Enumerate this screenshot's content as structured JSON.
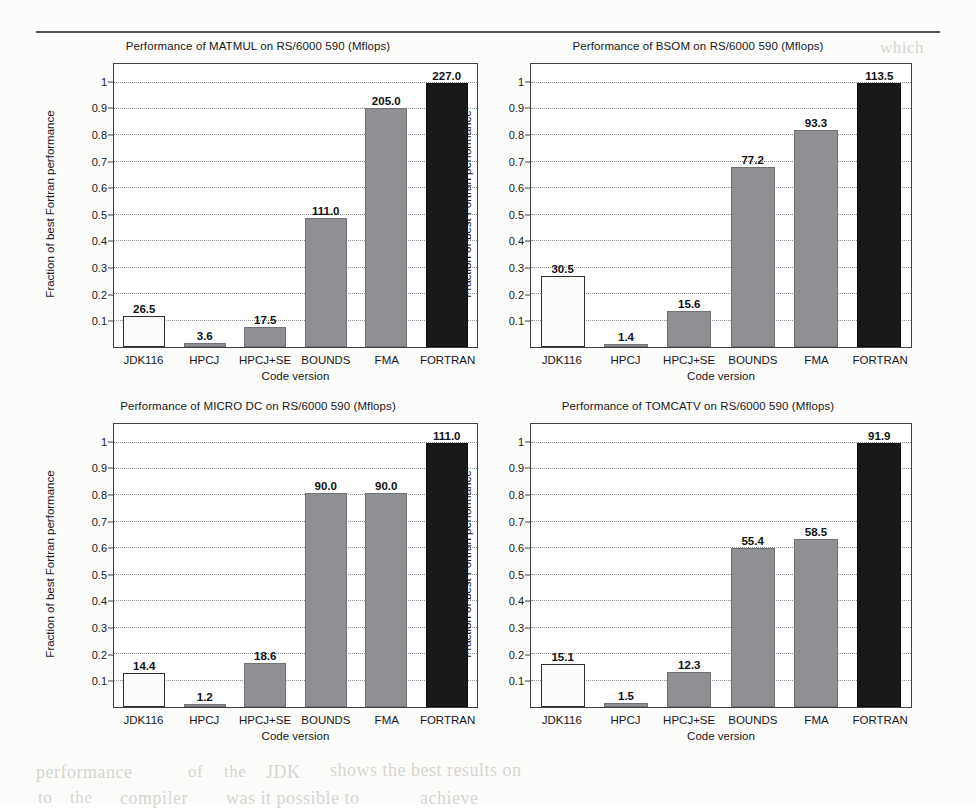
{
  "page": {
    "categories": [
      "JDK116",
      "HPCJ",
      "HPCJ+SE",
      "BOUNDS",
      "FMA",
      "FORTRAN"
    ],
    "ylabel": "Fraction of best Fortran performance",
    "xlabel": "Code version",
    "yticks": [
      "0.1",
      "0.2",
      "0.3",
      "0.4",
      "0.5",
      "0.6",
      "0.7",
      "0.8",
      "0.9",
      "1"
    ],
    "colors": {
      "bar_light": "#fbfbfa",
      "bar_gray": "#8e9093",
      "bar_black": "#18191b",
      "frame": "#3f4245",
      "grid": "#8d9093",
      "text": "#16181a"
    },
    "ghost_texts": [
      {
        "text": "which",
        "x": 880,
        "y": 38,
        "size": 17
      },
      {
        "text": "the",
        "x": 742,
        "y": 66,
        "size": 17
      },
      {
        "text": "benchmark",
        "x": 640,
        "y": 98,
        "size": 18
      },
      {
        "text": "of",
        "x": 790,
        "y": 128,
        "size": 17
      },
      {
        "text": "performance",
        "x": 36,
        "y": 762,
        "size": 18
      },
      {
        "text": "of",
        "x": 188,
        "y": 762,
        "size": 17
      },
      {
        "text": "the",
        "x": 224,
        "y": 762,
        "size": 17
      },
      {
        "text": "JDK",
        "x": 266,
        "y": 762,
        "size": 18
      },
      {
        "text": "shows the best results on",
        "x": 330,
        "y": 760,
        "size": 18
      },
      {
        "text": "to",
        "x": 38,
        "y": 788,
        "size": 17
      },
      {
        "text": "the",
        "x": 70,
        "y": 788,
        "size": 17
      },
      {
        "text": "compiler",
        "x": 120,
        "y": 788,
        "size": 18
      },
      {
        "text": "was it possible to",
        "x": 226,
        "y": 788,
        "size": 18
      },
      {
        "text": "achieve",
        "x": 420,
        "y": 788,
        "size": 18
      }
    ]
  },
  "chart_data": [
    {
      "type": "bar",
      "title": "Performance of MATMUL on RS/6000 590 (Mflops)",
      "xlabel": "Code version",
      "ylabel": "Fraction of best Fortran performance",
      "categories": [
        "JDK116",
        "HPCJ",
        "HPCJ+SE",
        "BOUNDS",
        "FMA",
        "FORTRAN"
      ],
      "values": [
        26.5,
        3.6,
        17.5,
        111.0,
        205.0,
        227.0
      ],
      "labels": [
        "26.5",
        "3.6",
        "17.5",
        "111.0",
        "205.0",
        "227.0"
      ],
      "fractions": [
        0.1167,
        0.0159,
        0.0771,
        0.489,
        0.9031,
        1.0
      ],
      "bar_styles": [
        "light",
        "gray",
        "gray",
        "gray",
        "gray",
        "black"
      ],
      "ylim": [
        0,
        1.07
      ],
      "grid": true
    },
    {
      "type": "bar",
      "title": "Performance of BSOM on RS/6000 590 (Mflops)",
      "xlabel": "Code version",
      "ylabel": "Fraction of best Fortran performance",
      "categories": [
        "JDK116",
        "HPCJ",
        "HPCJ+SE",
        "BOUNDS",
        "FMA",
        "FORTRAN"
      ],
      "values": [
        30.5,
        1.4,
        15.6,
        77.2,
        93.3,
        113.5
      ],
      "labels": [
        "30.5",
        "1.4",
        "15.6",
        "77.2",
        "93.3",
        "113.5"
      ],
      "fractions": [
        0.2687,
        0.0123,
        0.1374,
        0.6802,
        0.822,
        1.0
      ],
      "bar_styles": [
        "light",
        "gray",
        "gray",
        "gray",
        "gray",
        "black"
      ],
      "ylim": [
        0,
        1.07
      ],
      "grid": true
    },
    {
      "type": "bar",
      "title": "Performance of MICRO DC on RS/6000 590 (Mflops)",
      "xlabel": "Code version",
      "ylabel": "Fraction of best Fortran performance",
      "categories": [
        "JDK116",
        "HPCJ",
        "HPCJ+SE",
        "BOUNDS",
        "FMA",
        "FORTRAN"
      ],
      "values": [
        14.4,
        1.2,
        18.6,
        90.0,
        90.0,
        111.0
      ],
      "labels": [
        "14.4",
        "1.2",
        "18.6",
        "90.0",
        "90.0",
        "111.0"
      ],
      "fractions": [
        0.1297,
        0.0108,
        0.1676,
        0.8108,
        0.8108,
        1.0
      ],
      "bar_styles": [
        "light",
        "gray",
        "gray",
        "gray",
        "gray",
        "black"
      ],
      "ylim": [
        0,
        1.07
      ],
      "grid": true
    },
    {
      "type": "bar",
      "title": "Performance of TOMCATV on RS/6000 590 (Mflops)",
      "xlabel": "Code version",
      "ylabel": "Fraction of best Fortran performance",
      "categories": [
        "JDK116",
        "HPCJ",
        "HPCJ+SE",
        "BOUNDS",
        "FMA",
        "FORTRAN"
      ],
      "values": [
        15.1,
        1.5,
        12.3,
        55.4,
        58.5,
        91.9
      ],
      "labels": [
        "15.1",
        "1.5",
        "12.3",
        "55.4",
        "58.5",
        "91.9"
      ],
      "fractions": [
        0.1643,
        0.0163,
        0.1338,
        0.6028,
        0.6366,
        1.0
      ],
      "bar_styles": [
        "light",
        "gray",
        "gray",
        "gray",
        "gray",
        "black"
      ],
      "ylim": [
        0,
        1.07
      ],
      "grid": true
    }
  ]
}
